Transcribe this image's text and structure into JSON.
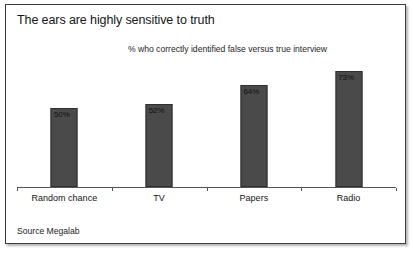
{
  "figure": {
    "title": "The ears are highly sensitive to truth",
    "subtitle": "% who correctly identified false versus true interview",
    "source": "Source Megalab",
    "bar_color": "#4a4a4a",
    "border_color": "#3d3d3d",
    "axis_color": "#555555"
  },
  "chart_data": {
    "type": "bar",
    "title": "The ears are highly sensitive to truth",
    "subtitle": "% who correctly identified false versus true interview",
    "xlabel": "",
    "ylabel": "",
    "ylim": [
      0,
      80
    ],
    "grid": false,
    "legend": "none",
    "categories": [
      "Random chance",
      "TV",
      "Papers",
      "Radio"
    ],
    "values": [
      50,
      52,
      64,
      73
    ],
    "value_labels": [
      "50%",
      "52%",
      "64%",
      "73%"
    ],
    "annotations": [
      "Source Megalab"
    ]
  }
}
